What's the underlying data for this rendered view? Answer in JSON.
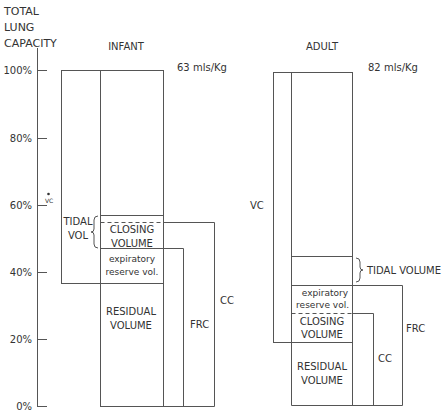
{
  "axis": {
    "title_lines": [
      "TOTAL",
      "LUNG",
      "CAPACITY"
    ],
    "ticks": [
      "100%",
      "80%",
      "60%",
      "40%",
      "20%",
      "0%"
    ],
    "vc_marker": "VC"
  },
  "infant": {
    "title": "INFANT",
    "rate": "63 mls/Kg",
    "tidal_vol": [
      "TIDAL",
      "VOL"
    ],
    "closing_volume": [
      "CLOSING",
      "VOLUME"
    ],
    "expiratory_reserve": [
      "expiratory",
      "reserve vol."
    ],
    "residual_volume": [
      "RESIDUAL",
      "VOLUME"
    ],
    "frc": "FRC",
    "cc": "CC"
  },
  "adult": {
    "title": "ADULT",
    "rate": "82 mls/Kg",
    "vc": "VC",
    "tidal_volume": "TIDAL VOLUME",
    "expiratory_reserve": [
      "expiratory",
      "reserve vol."
    ],
    "closing_volume": [
      "CLOSING",
      "VOLUME"
    ],
    "residual_volume": [
      "RESIDUAL",
      "VOLUME"
    ],
    "frc": "FRC",
    "cc": "CC"
  },
  "colors": {
    "line": "#555555",
    "text": "#333333"
  }
}
